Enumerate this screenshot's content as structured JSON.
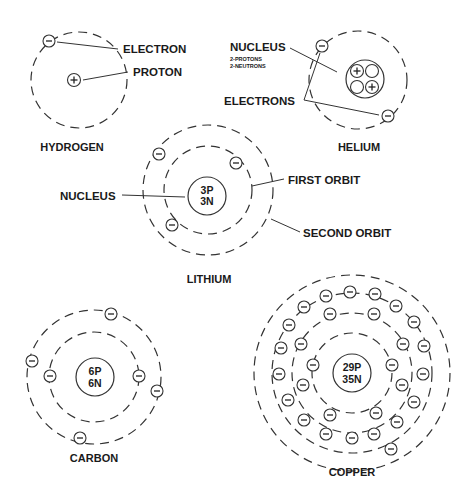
{
  "colors": {
    "ink": "#1a1a1a",
    "orbit": "#333333",
    "background": "#ffffff"
  },
  "atoms": {
    "hydrogen": {
      "name": "HYDROGEN",
      "labels": {
        "electron": "ELECTRON",
        "proton": "PROTON"
      },
      "proton_symbol": "+",
      "electron_symbol": "−"
    },
    "helium": {
      "name": "HELIUM",
      "labels": {
        "nucleus": "NUCLEUS",
        "protons": "2-PROTONS",
        "neutrons": "2-NEUTRONS",
        "electrons": "ELECTRONS"
      }
    },
    "lithium": {
      "name": "LITHIUM",
      "nucleus": {
        "line1": "3P",
        "line2": "3N"
      },
      "labels": {
        "nucleus": "NUCLEUS",
        "first_orbit": "FIRST ORBIT",
        "second_orbit": "SECOND ORBIT"
      }
    },
    "carbon": {
      "name": "CARBON",
      "nucleus": {
        "line1": "6P",
        "line2": "6N"
      }
    },
    "copper": {
      "name": "COPPER",
      "nucleus": {
        "line1": "29P",
        "line2": "35N"
      },
      "shell_electron_counts": [
        2,
        8,
        18,
        1
      ]
    }
  }
}
